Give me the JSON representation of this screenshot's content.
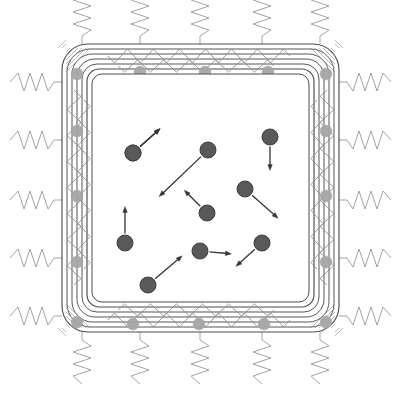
{
  "figure": {
    "type": "schematic-diagram",
    "title": "",
    "canvas": {
      "width": 399,
      "height": 397,
      "background": "#ffffff"
    }
  },
  "colors": {
    "wall_outline": "#4d4d4d",
    "wall_spring": "#8c8c8c",
    "external_spring": "#999999",
    "wall_atom": "#a6a6a6",
    "gas_particle": "#595959",
    "gas_particle_edge": "#3f3f3f",
    "arrow": "#333333",
    "interior_fill": "#ffffff"
  },
  "box": {
    "name": "simulation-box",
    "outer": {
      "x": 62,
      "y": 44,
      "width": 277,
      "height": 288,
      "radius": 26
    },
    "shell_count": 6,
    "shell_gap": 5,
    "interior": {
      "x": 92,
      "y": 74,
      "width": 217,
      "height": 228,
      "radius": 10
    }
  },
  "wall_springs": {
    "name": "wall-internal-springs",
    "description": "zigzag spring chain running inside the wall channel",
    "amplitude": 7,
    "period": 13,
    "stroke_width": 0.9
  },
  "wall_atoms": {
    "name": "wall-atom",
    "radius": 6,
    "positions": [
      {
        "x": 77,
        "y": 74
      },
      {
        "x": 140,
        "y": 72
      },
      {
        "x": 205,
        "y": 72
      },
      {
        "x": 268,
        "y": 72
      },
      {
        "x": 326,
        "y": 74
      },
      {
        "x": 77,
        "y": 131
      },
      {
        "x": 77,
        "y": 196
      },
      {
        "x": 77,
        "y": 262
      },
      {
        "x": 326,
        "y": 131
      },
      {
        "x": 326,
        "y": 196
      },
      {
        "x": 326,
        "y": 262
      },
      {
        "x": 77,
        "y": 322
      },
      {
        "x": 133,
        "y": 324
      },
      {
        "x": 199,
        "y": 324
      },
      {
        "x": 264,
        "y": 324
      },
      {
        "x": 326,
        "y": 322
      }
    ]
  },
  "external_springs": {
    "name": "external-spring",
    "description": "zigzag springs anchoring the box to a surrounding bath",
    "length": 52,
    "amplitude": 9,
    "coils": 3,
    "top": [
      {
        "x": 82
      },
      {
        "x": 140
      },
      {
        "x": 200
      },
      {
        "x": 262
      },
      {
        "x": 320
      }
    ],
    "bottom": [
      {
        "x": 82
      },
      {
        "x": 140
      },
      {
        "x": 200
      },
      {
        "x": 262
      },
      {
        "x": 320
      }
    ],
    "left": [
      {
        "y": 82
      },
      {
        "y": 140
      },
      {
        "y": 200
      },
      {
        "y": 258
      },
      {
        "y": 316
      }
    ],
    "right": [
      {
        "y": 82
      },
      {
        "y": 140
      },
      {
        "y": 200
      },
      {
        "y": 258
      },
      {
        "y": 316
      }
    ]
  },
  "gas_particles": {
    "name": "gas-particle",
    "radius": 8,
    "count": 10,
    "items": [
      {
        "id": "p1",
        "x": 133,
        "y": 153,
        "vx": 20,
        "vy": -18
      },
      {
        "id": "p2",
        "x": 208,
        "y": 150,
        "vx": -42,
        "vy": 40
      },
      {
        "id": "p3",
        "x": 270,
        "y": 137,
        "vx": 0,
        "vy": 24
      },
      {
        "id": "p4",
        "x": 245,
        "y": 189,
        "vx": 26,
        "vy": 23
      },
      {
        "id": "p5",
        "x": 207,
        "y": 213,
        "vx": -16,
        "vy": -16
      },
      {
        "id": "p6",
        "x": 125,
        "y": 243,
        "vx": 0,
        "vy": -27
      },
      {
        "id": "p7",
        "x": 200,
        "y": 251,
        "vx": 22,
        "vy": 2
      },
      {
        "id": "p8",
        "x": 262,
        "y": 243,
        "vx": -19,
        "vy": 17
      },
      {
        "id": "p9",
        "x": 148,
        "y": 285,
        "vx": 27,
        "vy": -23
      },
      {
        "id": "p10",
        "x": 133,
        "y": 153,
        "vx": 20,
        "vy": -18
      }
    ]
  },
  "arrows": {
    "name": "velocity-arrow",
    "head_length": 6,
    "head_width": 4.5,
    "stroke_width": 1.3
  }
}
